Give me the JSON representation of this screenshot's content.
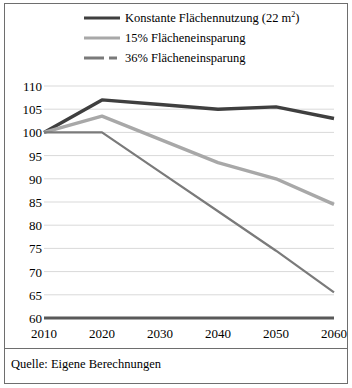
{
  "chart_data": {
    "type": "line",
    "title": "",
    "xlabel": "",
    "ylabel": "",
    "x": [
      2010,
      2020,
      2030,
      2040,
      2050,
      2060
    ],
    "categories": [
      "2010",
      "2020",
      "2030",
      "2040",
      "2050",
      "2060"
    ],
    "xlim": [
      2010,
      2060
    ],
    "ylim": [
      60,
      110
    ],
    "yticks": [
      60,
      65,
      70,
      75,
      80,
      85,
      90,
      95,
      100,
      105,
      110
    ],
    "ytick_labels": [
      "60",
      "65",
      "70",
      "75",
      "80",
      "85",
      "90",
      "95",
      "100",
      "105",
      "110"
    ],
    "xtick_labels": [
      "2010",
      "2020",
      "2030",
      "2040",
      "2050",
      "2060"
    ],
    "grid": true,
    "legend_position": "top",
    "series": [
      {
        "name": "Konstante Flächennutzung (22 m²)",
        "style": "solid",
        "color": "#3f3f3f",
        "width": 3.4,
        "values": [
          100,
          107,
          106,
          105,
          105.5,
          103
        ]
      },
      {
        "name": "15% Flächeneinsparung",
        "style": "solid",
        "color": "#a8a8a8",
        "width": 3.4,
        "values": [
          100,
          103.5,
          98.5,
          93.5,
          90,
          84.5
        ]
      },
      {
        "name": "36% Flächeneinsparung",
        "style": "dashed",
        "color": "#7a7a7a",
        "width": 2.2,
        "values": [
          100,
          100,
          91.5,
          83,
          74.5,
          65.5
        ]
      }
    ]
  },
  "legend": {
    "items": [
      {
        "label": "Konstante Flächennutzung (22 m",
        "sup": "2",
        "label_tail": ")",
        "swatch": "solid-dark"
      },
      {
        "label": "15% Flächeneinsparung",
        "swatch": "solid-light"
      },
      {
        "label": "36% Flächeneinsparung",
        "swatch": "dashed"
      }
    ]
  },
  "source": {
    "text": "Quelle: Eigene Berechnungen"
  },
  "colors": {
    "series_dark": "#3f3f3f",
    "series_light": "#a8a8a8",
    "series_dashed": "#7a7a7a",
    "grid": "#d9d9d9",
    "axis": "#595959",
    "frame": "#6e6e6e",
    "background": "#ffffff"
  }
}
